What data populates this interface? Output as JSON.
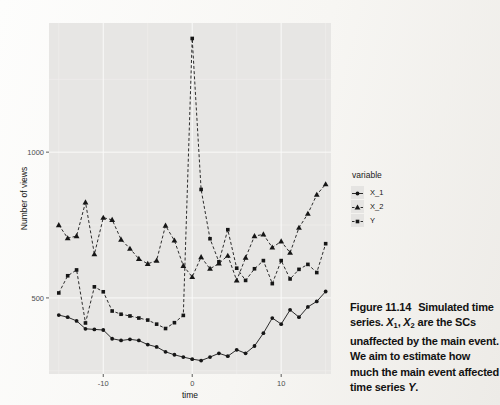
{
  "chart_data": {
    "type": "line",
    "title": "",
    "xlabel": "time",
    "ylabel": "Number of views",
    "legend_title": "variable",
    "legend_position": "right",
    "grid": true,
    "xlim": [
      -16.1,
      15.6
    ],
    "ylim": [
      239,
      1443
    ],
    "xticks": [
      -10,
      0,
      10
    ],
    "xticks_minor": [
      -15,
      -5,
      5,
      15
    ],
    "yticks": [
      500,
      1000
    ],
    "yticks_minor": [
      250,
      750,
      1250
    ],
    "x": [
      -15,
      -14,
      -13,
      -12,
      -11,
      -10,
      -9,
      -8,
      -7,
      -6,
      -5,
      -4,
      -3,
      -2,
      -1,
      0,
      1,
      2,
      3,
      4,
      5,
      6,
      7,
      8,
      9,
      10,
      11,
      12,
      13,
      14,
      15
    ],
    "series": [
      {
        "name": "X_1",
        "marker": "circle",
        "linestyle": "solid",
        "values": [
          441,
          434,
          421,
          394,
          392,
          390,
          360,
          354,
          358,
          354,
          340,
          332,
          315,
          305,
          297,
          290,
          285,
          297,
          310,
          300,
          322,
          310,
          335,
          379,
          431,
          410,
          459,
          434,
          469,
          488,
          522
        ]
      },
      {
        "name": "X_2",
        "marker": "triangle",
        "linestyle": "dashed",
        "values": [
          750,
          705,
          712,
          828,
          650,
          775,
          768,
          700,
          669,
          634,
          617,
          628,
          748,
          697,
          610,
          572,
          640,
          600,
          618,
          645,
          560,
          638,
          712,
          718,
          673,
          694,
          655,
          741,
          789,
          854,
          890
        ]
      },
      {
        "name": "Y",
        "marker": "square",
        "linestyle": "dashed",
        "values": [
          517,
          576,
          596,
          414,
          538,
          521,
          455,
          444,
          438,
          431,
          424,
          410,
          395,
          415,
          440,
          1390,
          872,
          703,
          624,
          734,
          602,
          560,
          600,
          628,
          549,
          628,
          565,
          598,
          615,
          587,
          686
        ]
      }
    ],
    "colors": {
      "series_color": "#161616",
      "panel_bg": "#e7e6e4",
      "grid_major": "#fafaf9",
      "grid_minor": "#f1f0ee",
      "tick_label": "#4d4d4d",
      "axis_title": "#111111",
      "tick_mark": "#333333"
    }
  },
  "caption": {
    "segments": [
      {
        "text": "Figure 11.14",
        "gap": true
      },
      {
        "text": "Simulated time series. "
      },
      {
        "text": "X",
        "italic": true
      },
      {
        "text": "1",
        "sub": true
      },
      {
        "text": ", "
      },
      {
        "text": "X",
        "italic": true
      },
      {
        "text": "2",
        "sub": true
      },
      {
        "text": " are the SCs unaffected by the main event. We aim to estimate how much the main event affected time series "
      },
      {
        "text": "Y",
        "italic": true
      },
      {
        "text": "."
      }
    ]
  }
}
